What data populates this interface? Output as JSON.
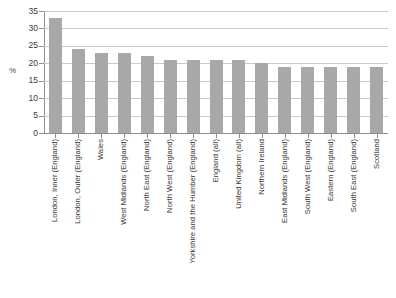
{
  "chart_data": {
    "type": "bar",
    "title": "",
    "subtitle": "",
    "xlabel": "",
    "ylabel": "%",
    "ylim": [
      0,
      35
    ],
    "ytick_step": 5,
    "yticks": [
      35,
      30,
      25,
      20,
      15,
      10,
      5,
      0
    ],
    "grid": true,
    "legend": false,
    "legend_position": "none",
    "bar_color": "#a8a8a8",
    "gridline_color": "#c9c9c9",
    "axis_color": "#8d8d8d",
    "categories": [
      "London, Inner (England)",
      "London, Outer (England)",
      "Wales",
      "West Midlands (England)",
      "North East (England)",
      "North West (England)",
      "Yorkshire and the Humber (England)",
      "England (all)",
      "United Kingdom (all)",
      "Northern Ireland",
      "East Midlands (England)",
      "South West (England)",
      "Eastern (England)",
      "South East (England)",
      "Scotland"
    ],
    "values": [
      33,
      24,
      23,
      23,
      22,
      21,
      21,
      21,
      21,
      20,
      19,
      19,
      19,
      19,
      19
    ]
  }
}
